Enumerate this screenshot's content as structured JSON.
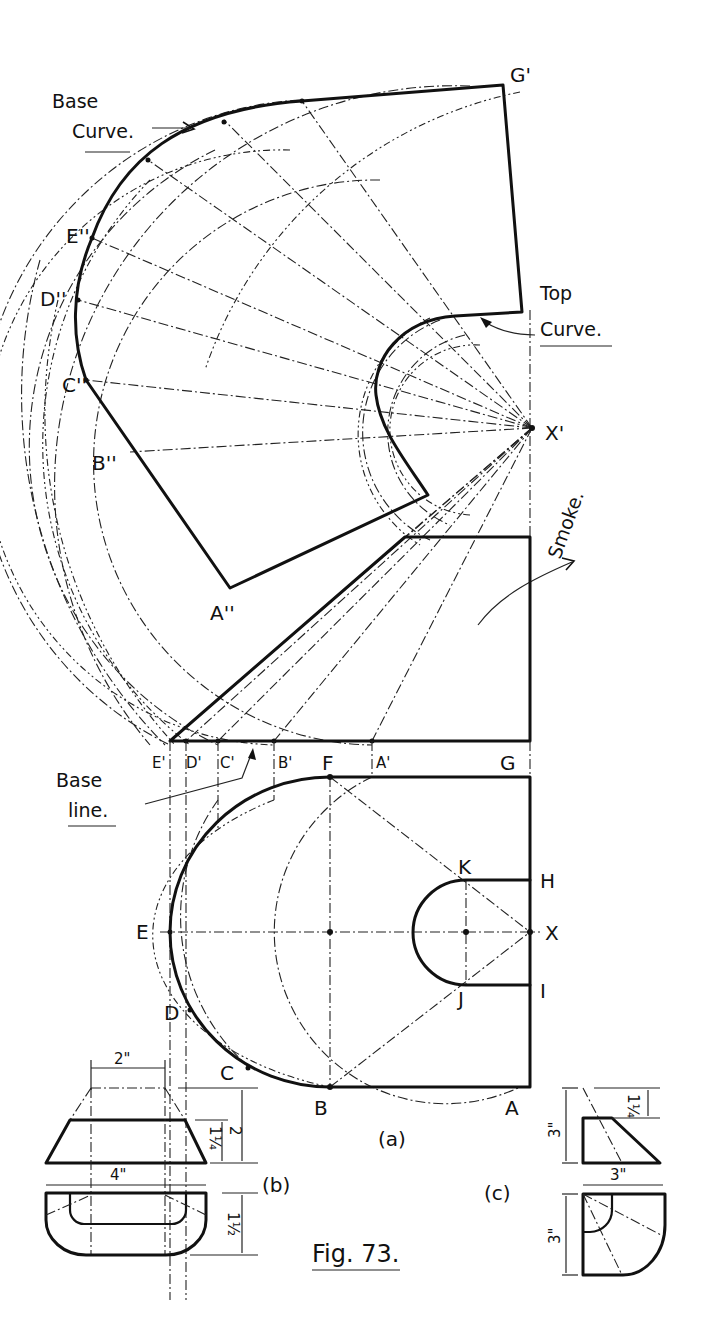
{
  "figure": {
    "title": "Fig. 73.",
    "subviews": [
      "(a)",
      "(b)",
      "(c)"
    ]
  },
  "annotations": {
    "base_curve": [
      "Base",
      "Curve."
    ],
    "top_curve": [
      "Top",
      "Curve."
    ],
    "smoke": "Smoke.",
    "base_line": [
      "Base",
      "line."
    ]
  },
  "development_points": {
    "g_prime": "G'",
    "e_dd": "E''",
    "d_dd": "D''",
    "c_dd": "C''",
    "b_dd": "B''",
    "a_dd": "A''",
    "x_prime": "X'"
  },
  "elevation_points": {
    "e_prime": "E'",
    "d_prime": "D'",
    "c_prime": "C'",
    "b_prime": "B'",
    "a_prime": "A'"
  },
  "plan_points": {
    "f": "F",
    "g": "G",
    "h": "H",
    "i": "I",
    "k": "K",
    "j": "J",
    "e": "E",
    "x": "X",
    "d": "D",
    "c": "C",
    "b": "B",
    "a": "A"
  },
  "dimensions_b": {
    "top_width": "2\"",
    "bottom_width": "4\"",
    "height_total": "2",
    "height_frustum": "1¼",
    "plan_depth": "1½"
  },
  "dimensions_c": {
    "height_total": "3\"",
    "height_top": "1¼",
    "width": "3\"",
    "plan_depth": "3\""
  }
}
